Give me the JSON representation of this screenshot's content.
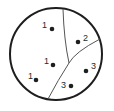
{
  "diagram": {
    "type": "partitioned-circle",
    "colors": {
      "outline": "#1e1e1e",
      "divider": "#555555",
      "dot": "#1e1e1e",
      "label": "#2a2a2a"
    },
    "circle": {
      "cx": 56,
      "cy": 54,
      "r": 46
    },
    "dividers": [
      {
        "id": "divider-1",
        "path": "M63,9 Q64,40 69,63"
      },
      {
        "id": "divider-2",
        "path": "M100,39 Q75,52 69,63 Q58,80 48,99"
      }
    ],
    "points": [
      {
        "label": "1",
        "x": 52,
        "y": 29,
        "lx": 42,
        "ly": 28
      },
      {
        "label": "2",
        "x": 78,
        "y": 42,
        "lx": 83,
        "ly": 41
      },
      {
        "label": "1",
        "x": 53,
        "y": 65,
        "lx": 44,
        "ly": 64
      },
      {
        "label": "1",
        "x": 36,
        "y": 80,
        "lx": 28,
        "ly": 79
      },
      {
        "label": "3",
        "x": 86,
        "y": 71,
        "lx": 91,
        "ly": 69
      },
      {
        "label": "3",
        "x": 71,
        "y": 86,
        "lx": 61,
        "ly": 88
      }
    ]
  }
}
